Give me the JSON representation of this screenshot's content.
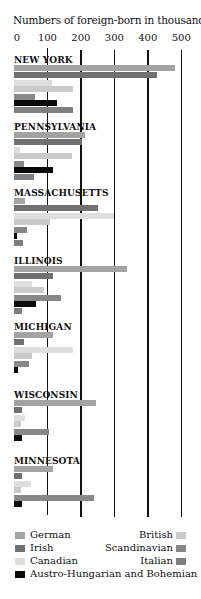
{
  "chart_data": {
    "type": "bar",
    "orientation": "horizontal",
    "title": "Numbers of foreign-born in thousands",
    "xlabel": "Numbers of foreign-born in thousands",
    "ylabel": "",
    "xlim": [
      0,
      500
    ],
    "x_ticks": [
      "0",
      "100",
      "200",
      "300",
      "400",
      "500"
    ],
    "grid": true,
    "legend_position": "bottom",
    "categories": [
      "NEW YORK",
      "PENNSYLVANIA",
      "MASSACHUSETTS",
      "ILLINOIS",
      "MICHIGAN",
      "WISCONSIN",
      "MINNESOTA"
    ],
    "series": [
      {
        "name": "German",
        "color": "#a3a3a3",
        "values": [
          480,
          212,
          33,
          337,
          117,
          245,
          117
        ]
      },
      {
        "name": "Irish",
        "color": "#707070",
        "values": [
          427,
          203,
          250,
          117,
          30,
          23,
          23
        ]
      },
      {
        "name": "Canadian",
        "color": "#dedede",
        "values": [
          115,
          18,
          298,
          53,
          175,
          33,
          50
        ]
      },
      {
        "name": "British",
        "color": "#cacaca",
        "values": [
          175,
          173,
          107,
          90,
          53,
          20,
          20
        ]
      },
      {
        "name": "Scandinavian",
        "color": "#888888",
        "values": [
          63,
          30,
          40,
          140,
          45,
          105,
          240
        ]
      },
      {
        "name": "Austro-Hungarian and Bohemian",
        "color": "#0a0a0a",
        "values": [
          128,
          117,
          8,
          65,
          12,
          25,
          25
        ]
      },
      {
        "name": "Italian",
        "color": "#7e7e7e",
        "values": [
          175,
          60,
          28,
          23,
          0,
          0,
          0
        ]
      }
    ]
  },
  "legend": {
    "left": [
      {
        "label": "German",
        "color": "#a3a3a3"
      },
      {
        "label": "Irish",
        "color": "#707070"
      },
      {
        "label": "Canadian",
        "color": "#dedede"
      },
      {
        "label": "Austro-Hungarian and Bohemian",
        "color": "#0a0a0a"
      }
    ],
    "right": [
      {
        "label": "British",
        "color": "#cacaca"
      },
      {
        "label": "Scandinavian",
        "color": "#888888"
      },
      {
        "label": "Italian",
        "color": "#7e7e7e"
      }
    ]
  }
}
